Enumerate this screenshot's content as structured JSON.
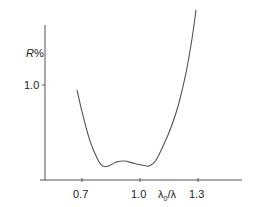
{
  "chart_data": {
    "type": "line",
    "title": "",
    "xlabel": "λ0/λ",
    "ylabel": "R%",
    "x_ticks": [
      0.7,
      1.0,
      1.3
    ],
    "x_tick_labels": [
      "0.7",
      "1.0",
      "1.3"
    ],
    "y_ticks": [
      1.0
    ],
    "y_tick_labels": [
      "1.0"
    ],
    "xlim": [
      0.5,
      1.5
    ],
    "ylim": [
      0,
      1.9
    ],
    "grid": false,
    "legend": null,
    "series": [
      {
        "name": "reflectance",
        "x": [
          0.674,
          0.7,
          0.74,
          0.78,
          0.8,
          0.82,
          0.85,
          0.88,
          0.92,
          0.96,
          1.0,
          1.03,
          1.05,
          1.08,
          1.12,
          1.16,
          1.2,
          1.24,
          1.27,
          1.29
        ],
        "y": [
          0.95,
          0.72,
          0.42,
          0.22,
          0.16,
          0.14,
          0.16,
          0.19,
          0.2,
          0.18,
          0.16,
          0.15,
          0.15,
          0.2,
          0.36,
          0.55,
          0.8,
          1.15,
          1.5,
          1.79
        ]
      }
    ]
  },
  "labels": {
    "ylabel_main": "R",
    "ylabel_unit": "%",
    "xlabel": "λ0/λ",
    "x_ticks": [
      "0.7",
      "1.0",
      "1.3"
    ],
    "y_tick": "1.0"
  }
}
